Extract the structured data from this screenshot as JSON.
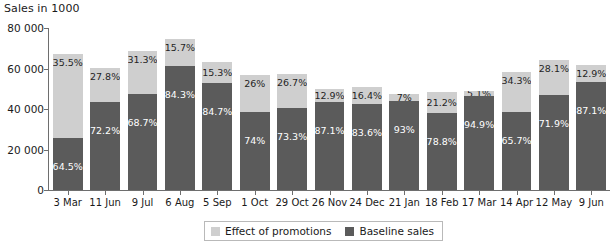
{
  "chart_data": {
    "type": "bar",
    "subtype": "stacked-bar",
    "title": "Sales in 1000",
    "xlabel": "",
    "ylabel": "Sales in 1000",
    "ylim": [
      0,
      80000
    ],
    "yticks": [
      0,
      20000,
      40000,
      60000,
      80000
    ],
    "ytick_labels": [
      "0",
      "20 000",
      "40 000",
      "60 000",
      "80 000"
    ],
    "grid": false,
    "legend_position": "bottom-center",
    "categories": [
      "3 Mar",
      "11 Jun",
      "9 Jul",
      "6 Aug",
      "5 Sep",
      "1 Oct",
      "29 Oct",
      "26 Nov",
      "24 Dec",
      "21 Jan",
      "18 Feb",
      "17 Mar",
      "14 Apr",
      "12 May",
      "9 Jun"
    ],
    "series": [
      {
        "name": "Baseline sales",
        "color": "#5b5b5b",
        "values": [
          25500,
          43500,
          47500,
          61000,
          53000,
          38500,
          40500,
          43500,
          42500,
          44000,
          38000,
          46500,
          38500,
          47000,
          53500
        ],
        "labels": [
          "64.5%",
          "72.2%",
          "68.7%",
          "84.3%",
          "84.7%",
          "74%",
          "73.3%",
          "87.1%",
          "83.6%",
          "93%",
          "78.8%",
          "94.9%",
          "65.7%",
          "71.9%",
          "87.1%"
        ]
      },
      {
        "name": "Effect of promotions",
        "color": "#cfcfcf",
        "values": [
          41500,
          17000,
          21000,
          13500,
          10000,
          18500,
          17000,
          6500,
          8500,
          3500,
          10500,
          2500,
          20000,
          17000,
          8000
        ],
        "labels": [
          "35.5%",
          "27.8%",
          "31.3%",
          "15.7%",
          "15.3%",
          "26%",
          "26.7%",
          "12.9%",
          "16.4%",
          "7%",
          "21.2%",
          "5.1%",
          "34.3%",
          "28.1%",
          "12.9%"
        ]
      }
    ],
    "totals": [
      67000,
      60500,
      68500,
      74500,
      63000,
      57000,
      57500,
      50000,
      51000,
      47500,
      48500,
      49000,
      58500,
      64000,
      61500
    ]
  },
  "legend": {
    "items": [
      {
        "label": "Effect of promotions",
        "color": "#cfcfcf"
      },
      {
        "label": "Baseline sales",
        "color": "#5b5b5b"
      }
    ]
  }
}
